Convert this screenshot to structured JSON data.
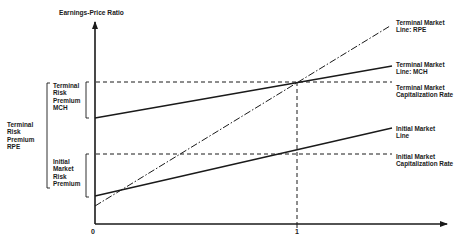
{
  "diagram": {
    "y_axis_label": "Earnings-Price Ratio",
    "x_ticks": [
      "0",
      "1"
    ],
    "right_labels": {
      "terminal_rpe": "Terminal Market\nLine: RPE",
      "terminal_mch": "Terminal Market\nLine: MCH",
      "terminal_cap_rate": "Terminal Market\nCapitalization Rate",
      "initial_line": "Initial Market\nLine",
      "initial_cap_rate": "Initial Market\nCapitalization Rate"
    },
    "left_labels": {
      "terminal_risk_premium_mch": "Terminal\nRisk\nPremium\nMCH",
      "terminal_risk_premium_rpe": "Terminal\nRisk\nPremium\nRPE",
      "initial_market_risk_premium": "Initial\nMarket\nRisk\nPremium"
    },
    "line_color": "#1a1a1a",
    "lines": [
      {
        "name": "Terminal Market Line: RPE",
        "style": "dash-dot",
        "from": [
          0,
          "below initial intercept"
        ],
        "to": [
          1,
          "terminal cap rate"
        ]
      },
      {
        "name": "Terminal Market Line: MCH",
        "style": "solid"
      },
      {
        "name": "Initial Market Line",
        "style": "solid"
      },
      {
        "name": "Terminal Market Capitalization Rate",
        "style": "dashed",
        "horizontal": true
      },
      {
        "name": "Initial Market Capitalization Rate",
        "style": "dashed",
        "horizontal": true
      },
      {
        "name": "x = 1",
        "style": "dashed",
        "vertical": true
      }
    ]
  }
}
